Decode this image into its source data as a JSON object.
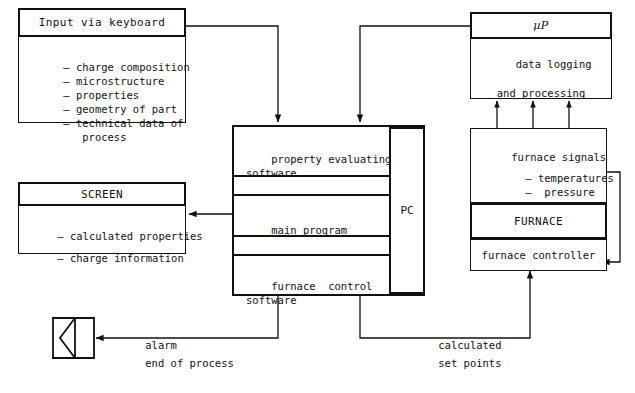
{
  "diagram": {
    "accent": "#111111",
    "background": "#ffffff"
  },
  "input_block": {
    "header": "Input via keyboard",
    "items": [
      "– charge composition",
      "– microstructure",
      "– properties",
      "– geometry of part",
      "– technical data of",
      "   process"
    ]
  },
  "screen_block": {
    "header": "SCREEN",
    "items": [
      "– calculated properties",
      "",
      "– charge information"
    ]
  },
  "pc_block": {
    "label": "PC",
    "rows": [
      "property evaluating\nsoftware",
      "main program",
      "furnace  control\nsoftware"
    ],
    "row_labels": [
      "property-evaluating-software",
      "main-program",
      "furnace-control-software"
    ]
  },
  "up_block": {
    "header": "µP",
    "body": "data logging\n\nand processing"
  },
  "furnace_signals_block": {
    "header": "furnace signals",
    "items": [
      "– temperatures",
      "–  pressure",
      "– atmosphere"
    ]
  },
  "furnace_block": {
    "header": "FURNACE"
  },
  "furnace_controller_block": {
    "label": "furnace controller"
  },
  "alarm": {
    "icon": "horn-speaker-icon",
    "line1": "alarm",
    "line2": "end of process"
  },
  "setpoints": {
    "line1": "calculated",
    "line2": "set points"
  }
}
